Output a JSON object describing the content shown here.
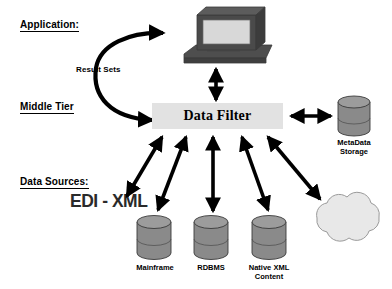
{
  "diagram": {
    "type": "architecture-diagram",
    "background_color": "#ffffff"
  },
  "tiers": [
    {
      "id": "application",
      "label": "Application:",
      "underlined": true
    },
    {
      "id": "middle_tier",
      "label": "Middle Tier",
      "underlined": true
    },
    {
      "id": "data_sources",
      "label": "Data Sources:",
      "underlined": true
    }
  ],
  "nodes": {
    "computer": {
      "shape": "computer-monitor",
      "label": "",
      "body_color": "#4a4a4a",
      "screen_color": "#d8d8d8"
    },
    "data_filter": {
      "shape": "rectangle",
      "label": "Data Filter",
      "fill_color": "#e2e2e2"
    },
    "metadata_storage": {
      "shape": "cylinder",
      "label": "MetaData\nStorage",
      "fill_color": "#8a8a8a"
    },
    "mainframe": {
      "shape": "cylinder",
      "label": "Mainframe",
      "fill_color": "#8a8a8a"
    },
    "rdbms": {
      "shape": "cylinder",
      "label": "RDBMS",
      "fill_color": "#8a8a8a"
    },
    "native_xml": {
      "shape": "cylinder",
      "label": "Native XML\nContent",
      "fill_color": "#8a8a8a"
    },
    "internet": {
      "shape": "cloud",
      "label": "Internet",
      "fill_color": "#e8e8e8"
    },
    "edi_xml": {
      "shape": "text",
      "label": "EDI - XML",
      "color": "#2a2a2a"
    }
  },
  "connections": [
    {
      "id": "result-sets",
      "from": "data_filter",
      "to": "computer",
      "label": "Result Sets",
      "style": "curved-double-arrow"
    },
    {
      "id": "computer-filter",
      "from": "computer",
      "to": "data_filter",
      "label": "",
      "style": "vertical-double-arrow"
    },
    {
      "id": "filter-metadata",
      "from": "data_filter",
      "to": "metadata_storage",
      "label": "",
      "style": "horizontal-double-arrow"
    },
    {
      "id": "filter-edixml",
      "from": "data_filter",
      "to": "edi_xml",
      "label": "",
      "style": "diagonal-double-arrow"
    },
    {
      "id": "filter-mainframe",
      "from": "data_filter",
      "to": "mainframe",
      "label": "",
      "style": "diagonal-double-arrow"
    },
    {
      "id": "filter-rdbms",
      "from": "data_filter",
      "to": "rdbms",
      "label": "",
      "style": "vertical-double-arrow"
    },
    {
      "id": "filter-nativexml",
      "from": "data_filter",
      "to": "native_xml",
      "label": "",
      "style": "diagonal-double-arrow"
    },
    {
      "id": "filter-internet",
      "from": "data_filter",
      "to": "internet",
      "label": "",
      "style": "diagonal-double-arrow"
    }
  ],
  "colors": {
    "arrow": "#000000",
    "cylinder_fill": "#8a8a8a",
    "cylinder_top": "#9a9a9a",
    "cylinder_stroke": "#3a3a3a",
    "cloud_fill": "#e8e8e8",
    "cloud_stroke": "#9a9a9a",
    "box_fill": "#e2e2e2",
    "monitor_body": "#4a4a4a",
    "monitor_screen": "#d8d8d8",
    "text": "#000000"
  }
}
